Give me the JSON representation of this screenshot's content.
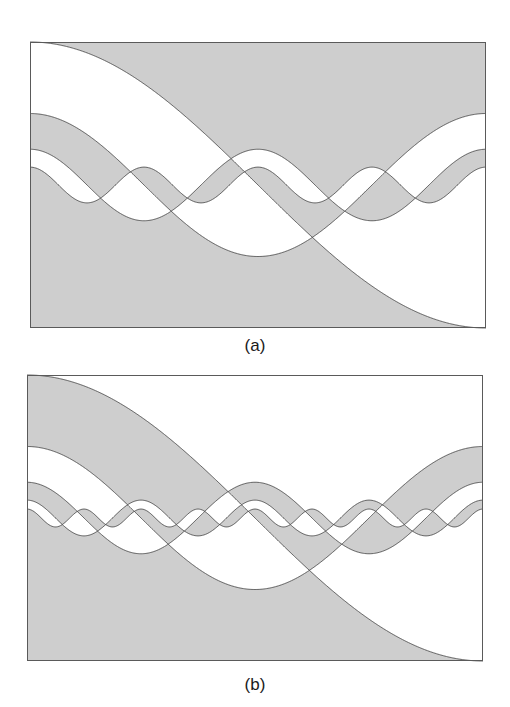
{
  "figure": {
    "colors": {
      "fill": "#cecece",
      "background": "#ffffff",
      "stroke": "#4a4a4a",
      "border": "#5a5a5a"
    },
    "panels": [
      {
        "id": "a",
        "label": "(a)",
        "box": {
          "x": 30,
          "y": 42,
          "width": 456,
          "height": 286
        },
        "label_pos": {
          "x": 215,
          "y": 336
        },
        "num_curves": 4,
        "shade_parity": "even",
        "curves": [
          {
            "index": 1,
            "amplitude_fraction": 0.5,
            "cycles": 0.5
          },
          {
            "index": 2,
            "amplitude_fraction": 0.25,
            "cycles": 1
          },
          {
            "index": 3,
            "amplitude_fraction": 0.125,
            "cycles": 2
          },
          {
            "index": 4,
            "amplitude_fraction": 0.0625,
            "cycles": 4
          }
        ]
      },
      {
        "id": "b",
        "label": "(b)",
        "box": {
          "x": 27,
          "y": 375,
          "width": 456,
          "height": 286
        },
        "label_pos": {
          "x": 215,
          "y": 675
        },
        "num_curves": 5,
        "shade_parity": "odd",
        "curves": [
          {
            "index": 1,
            "amplitude_fraction": 0.5,
            "cycles": 0.5
          },
          {
            "index": 2,
            "amplitude_fraction": 0.25,
            "cycles": 1
          },
          {
            "index": 3,
            "amplitude_fraction": 0.125,
            "cycles": 2
          },
          {
            "index": 4,
            "amplitude_fraction": 0.0625,
            "cycles": 4
          },
          {
            "index": 5,
            "amplitude_fraction": 0.03125,
            "cycles": 8
          }
        ]
      }
    ]
  }
}
